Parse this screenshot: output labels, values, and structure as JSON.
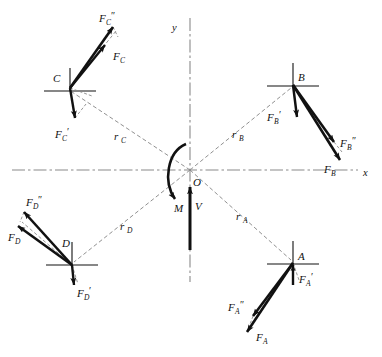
{
  "figure": {
    "background_color": "#ffffff",
    "ink_color": "#111111",
    "construction_color": "#8a8a8a",
    "width": 382,
    "height": 357
  },
  "axes": {
    "origin_label": "O",
    "x_label": "x",
    "y_label": "y",
    "origin": {
      "x": 190,
      "y": 170
    },
    "x_axis": {
      "x1": 12,
      "y1": 170,
      "x2": 358,
      "y2": 170
    },
    "y_axis": {
      "x1": 190,
      "y1": 18,
      "x2": 190,
      "y2": 282
    },
    "style": "dash-dot"
  },
  "resultants": {
    "moment": {
      "label": "M",
      "sense": "clockwise",
      "label_pos": {
        "x": 178,
        "y": 208
      }
    },
    "shear": {
      "label": "V",
      "direction": "up",
      "label_pos": {
        "x": 197,
        "y": 207
      },
      "tail": {
        "x": 190,
        "y": 250
      },
      "head": {
        "x": 190,
        "y": 187
      }
    }
  },
  "points": [
    {
      "name": "C",
      "label": "C",
      "label_pos": {
        "x": 56,
        "y": 78
      },
      "at": {
        "x": 70,
        "y": 88
      },
      "radius_label": "r",
      "radius_sub": "C",
      "radius_label_pos": {
        "x": 116,
        "y": 138
      },
      "forces": [
        {
          "label": "F",
          "sub": "C",
          "prime": "″",
          "tail": {
            "x": 70,
            "y": 88
          },
          "head": {
            "x": 113,
            "y": 27
          },
          "label_pos": {
            "x": 100,
            "y": 18
          },
          "weight": "heavy"
        },
        {
          "label": "F",
          "sub": "C",
          "prime": "",
          "tail": {
            "x": 70,
            "y": 88
          },
          "head": {
            "x": 105,
            "y": 45
          },
          "label_pos": {
            "x": 114,
            "y": 57
          },
          "weight": "heavy"
        },
        {
          "label": "F",
          "sub": "C",
          "prime": "′",
          "tail": {
            "x": 70,
            "y": 88
          },
          "head": {
            "x": 75,
            "y": 118
          },
          "label_pos": {
            "x": 58,
            "y": 135
          },
          "weight": "heavy"
        }
      ]
    },
    {
      "name": "B",
      "label": "B",
      "label_pos": {
        "x": 300,
        "y": 80
      },
      "at": {
        "x": 293,
        "y": 85
      },
      "radius_label": "r",
      "radius_sub": "B",
      "radius_label_pos": {
        "x": 234,
        "y": 136
      },
      "forces": [
        {
          "label": "F",
          "sub": "B",
          "prime": "′",
          "tail": {
            "x": 293,
            "y": 85
          },
          "head": {
            "x": 297,
            "y": 117
          },
          "label_pos": {
            "x": 272,
            "y": 118
          },
          "weight": "heavy"
        },
        {
          "label": "F",
          "sub": "B",
          "prime": "″",
          "tail": {
            "x": 293,
            "y": 85
          },
          "head": {
            "x": 334,
            "y": 142
          },
          "label_pos": {
            "x": 341,
            "y": 143
          },
          "weight": "heavy"
        },
        {
          "label": "F",
          "sub": "B",
          "prime": "",
          "tail": {
            "x": 293,
            "y": 85
          },
          "head": {
            "x": 340,
            "y": 160
          },
          "label_pos": {
            "x": 327,
            "y": 170
          },
          "weight": "heavy"
        }
      ]
    },
    {
      "name": "D",
      "label": "D",
      "label_pos": {
        "x": 64,
        "y": 243
      },
      "at": {
        "x": 72,
        "y": 265
      },
      "radius_label": "r",
      "radius_sub": "D",
      "radius_label_pos": {
        "x": 122,
        "y": 228
      },
      "forces": [
        {
          "label": "F",
          "sub": "D",
          "prime": "″",
          "tail": {
            "x": 72,
            "y": 265
          },
          "head": {
            "x": 24,
            "y": 212
          },
          "label_pos": {
            "x": 27,
            "y": 202
          },
          "weight": "heavy"
        },
        {
          "label": "F",
          "sub": "D",
          "prime": "",
          "tail": {
            "x": 72,
            "y": 265
          },
          "head": {
            "x": 18,
            "y": 226
          },
          "label_pos": {
            "x": 9,
            "y": 238
          },
          "weight": "heavy"
        },
        {
          "label": "F",
          "sub": "D",
          "prime": "′",
          "tail": {
            "x": 72,
            "y": 265
          },
          "head": {
            "x": 74,
            "y": 285
          },
          "label_pos": {
            "x": 78,
            "y": 294
          },
          "weight": "heavy"
        }
      ]
    },
    {
      "name": "A",
      "label": "A",
      "label_pos": {
        "x": 300,
        "y": 258
      },
      "at": {
        "x": 293,
        "y": 263
      },
      "radius_label": "r",
      "radius_sub": "A",
      "radius_label_pos": {
        "x": 238,
        "y": 218
      },
      "forces": [
        {
          "label": "F",
          "sub": "A",
          "prime": "′",
          "tail": {
            "x": 293,
            "y": 285
          },
          "head": {
            "x": 293,
            "y": 265
          },
          "label_pos": {
            "x": 300,
            "y": 280
          },
          "weight": "heavy"
        },
        {
          "label": "F",
          "sub": "A",
          "prime": "″",
          "tail": {
            "x": 293,
            "y": 263
          },
          "head": {
            "x": 253,
            "y": 316
          },
          "label_pos": {
            "x": 232,
            "y": 308
          },
          "weight": "heavy"
        },
        {
          "label": "F",
          "sub": "A",
          "prime": "",
          "tail": {
            "x": 293,
            "y": 263
          },
          "head": {
            "x": 247,
            "y": 332
          },
          "label_pos": {
            "x": 256,
            "y": 338
          },
          "weight": "heavy"
        }
      ]
    }
  ]
}
